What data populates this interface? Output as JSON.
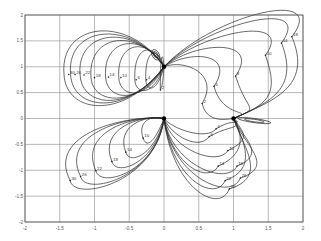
{
  "chart_data": {
    "type": "line",
    "title": "",
    "xlabel": "",
    "ylabel": "",
    "xlim": [
      -2,
      2
    ],
    "ylim": [
      -2,
      2
    ],
    "grid": true,
    "x_ticks": [
      "-2",
      "-1.5",
      "-1",
      "-0.5",
      "0",
      "0.5",
      "1",
      "1.5",
      "2"
    ],
    "y_ticks": [
      "2",
      "1.5",
      "1",
      "0.5",
      "0",
      "-0.5",
      "-1",
      "-1.5",
      "-2"
    ],
    "singular_points": [
      [
        0,
        1
      ],
      [
        0,
        0
      ],
      [
        1,
        0
      ]
    ],
    "families": [
      {
        "name": "upper-left lobes",
        "anchor": [
          0,
          1
        ],
        "direction": "left",
        "labels": [
          "2",
          "4",
          "6",
          "10",
          "14",
          "18",
          "22",
          "26",
          "30"
        ],
        "label_points": [
          [
            -0.05,
            0.55
          ],
          [
            -0.25,
            0.75
          ],
          [
            -0.4,
            0.75
          ],
          [
            -0.62,
            0.79
          ],
          [
            -0.8,
            0.8
          ],
          [
            -1.0,
            0.79
          ],
          [
            -1.15,
            0.84
          ],
          [
            -1.28,
            0.85
          ],
          [
            -1.37,
            0.85
          ]
        ]
      },
      {
        "name": "upper-right lobes",
        "anchor": [
          0,
          1
        ],
        "direction": "right",
        "labels": [
          "2",
          "4",
          "8",
          "10",
          "14",
          "18"
        ],
        "label_points": [
          [
            0.55,
            0.29
          ],
          [
            0.72,
            0.62
          ],
          [
            1.03,
            0.82
          ],
          [
            1.46,
            1.22
          ],
          [
            1.69,
            1.46
          ],
          [
            1.84,
            1.58
          ]
        ]
      },
      {
        "name": "lower-left lobes",
        "anchor": [
          0,
          0
        ],
        "direction": "down-left",
        "labels": [
          "10",
          "14",
          "18",
          "22",
          "26",
          "30"
        ],
        "label_points": [
          [
            -0.3,
            -0.38
          ],
          [
            -0.55,
            -0.65
          ],
          [
            -0.75,
            -0.83
          ],
          [
            -0.98,
            -1.01
          ],
          [
            -1.2,
            -1.12
          ],
          [
            -1.35,
            -1.2
          ]
        ]
      },
      {
        "name": "lower-right lobes",
        "anchor": [
          0,
          0
        ],
        "direction": "down-right",
        "labels": [
          "4",
          "6",
          "10",
          "14",
          "18",
          "22",
          "26",
          "30"
        ],
        "label_points": [
          [
            0.75,
            -0.2
          ],
          [
            0.65,
            -0.35
          ],
          [
            0.92,
            -0.62
          ],
          [
            0.78,
            -0.92
          ],
          [
            1.05,
            -0.92
          ],
          [
            0.88,
            -1.2
          ],
          [
            1.1,
            -1.15
          ],
          [
            0.94,
            -1.36
          ]
        ]
      }
    ],
    "small_loops": [
      {
        "center": [
          -0.12,
          1.23
        ],
        "rx": 0.05,
        "ry": 0.11,
        "angle": -30
      },
      {
        "center": [
          1.3,
          -0.04
        ],
        "rx": 0.24,
        "ry": 0.04,
        "angle": 8
      }
    ]
  }
}
